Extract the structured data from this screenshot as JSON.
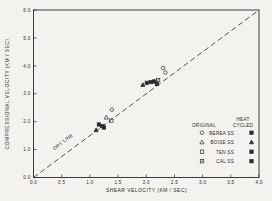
{
  "figure": {
    "background": "#f3f2ee",
    "ink": "#2b2b2b"
  },
  "chart_data": {
    "type": "scatter",
    "title": "",
    "xlabel": "SHEAR VELOCITY (KM / SEC)",
    "ylabel": "COMPRESSIONAL VELOCITY (KM / SEC)",
    "xlim": [
      0.0,
      4.0
    ],
    "ylim": [
      0.0,
      6.0
    ],
    "xticks": [
      0.0,
      0.5,
      1.0,
      1.5,
      2.0,
      2.5,
      3.0,
      3.5,
      4.0
    ],
    "yticks": [
      0.0,
      1.0,
      2.0,
      3.0,
      4.0,
      5.0,
      6.0
    ],
    "grid": false,
    "reference_line": {
      "label": "DRY LINE",
      "from": [
        0.0,
        0.0
      ],
      "to": [
        4.0,
        6.0
      ],
      "style": "dashed"
    },
    "series": [
      {
        "name": "BEREA SS original",
        "marker": "circle",
        "filled": false,
        "points": [
          [
            2.3,
            3.92
          ],
          [
            2.34,
            3.76
          ],
          [
            1.39,
            2.43
          ]
        ]
      },
      {
        "name": "BOISE SS original",
        "marker": "triangle",
        "filled": false,
        "points": [
          [
            1.29,
            2.15
          ]
        ]
      },
      {
        "name": "TEN SS original",
        "marker": "square",
        "filled": false,
        "points": [
          [
            1.38,
            2.04
          ]
        ]
      },
      {
        "name": "CAL SS original",
        "marker": "square-slash",
        "filled": false,
        "points": [
          [
            2.21,
            3.49
          ]
        ]
      },
      {
        "name": "BEREA SS heat cycled",
        "marker": "square",
        "filled": true,
        "points": [
          [
            2.01,
            3.39
          ],
          [
            1.16,
            1.9
          ]
        ]
      },
      {
        "name": "BOISE SS heat cycled",
        "marker": "triangle",
        "filled": true,
        "points": [
          [
            1.94,
            3.32
          ],
          [
            1.11,
            1.7
          ]
        ]
      },
      {
        "name": "TEN SS heat cycled",
        "marker": "square",
        "filled": true,
        "points": [
          [
            2.08,
            3.42
          ],
          [
            1.22,
            1.84
          ]
        ]
      },
      {
        "name": "CAL SS heat cycled",
        "marker": "square",
        "filled": true,
        "points": [
          [
            2.14,
            3.44
          ],
          [
            2.19,
            3.35
          ],
          [
            1.25,
            1.79
          ]
        ]
      }
    ],
    "legend": {
      "position": "inside-right-bottom",
      "col_original": "ORIGINAL",
      "col_heat_line1": "HEAT",
      "col_heat_line2": "CYCLED",
      "rows": [
        {
          "label": "BEREA SS",
          "original_marker": "circle-open",
          "heat_marker": "square-filled"
        },
        {
          "label": "BOISE SS",
          "original_marker": "triangle-open",
          "heat_marker": "triangle-filled"
        },
        {
          "label": "TEN SS",
          "original_marker": "square-open",
          "heat_marker": "square-filled"
        },
        {
          "label": "CAL SS",
          "original_marker": "square-slash-open",
          "heat_marker": "square-filled"
        }
      ]
    }
  }
}
